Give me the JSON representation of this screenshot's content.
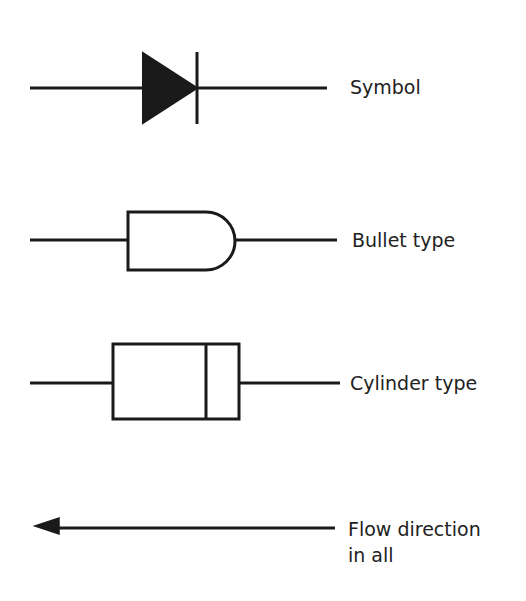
{
  "diagram": {
    "stroke_color": "#1a1a1a",
    "background": "#ffffff",
    "items": [
      {
        "id": "symbol",
        "label": "Symbol",
        "shape": "diode-symbol"
      },
      {
        "id": "bullet",
        "label": "Bullet type",
        "shape": "bullet-body"
      },
      {
        "id": "cylinder",
        "label": "Cylinder type",
        "shape": "cylinder-body"
      },
      {
        "id": "flow",
        "label_line1": "Flow direction",
        "label_line2": "in all",
        "shape": "left-arrow"
      }
    ]
  }
}
